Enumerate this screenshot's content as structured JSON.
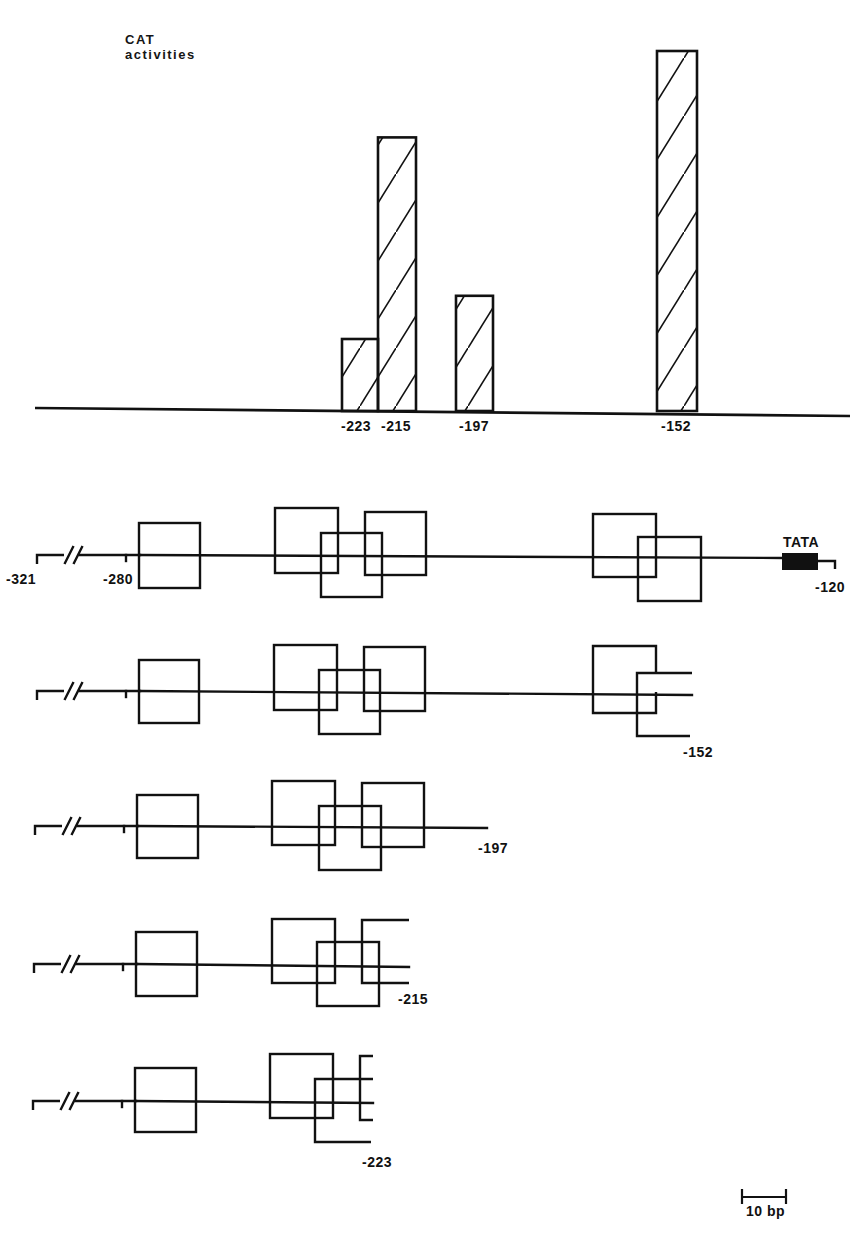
{
  "chart_data": {
    "type": "bar",
    "title": "",
    "ylabel": "CAT activities",
    "ylabel_lines": [
      "CAT",
      "activities"
    ],
    "xlabel": "",
    "y_scale": "relative (no numeric axis shown; tallest bar = 100)",
    "ylim": [
      0,
      100
    ],
    "grid": false,
    "legend": null,
    "bar_fill": "diagonal hatching",
    "categories": [
      "-223",
      "-215",
      "-197",
      "-152"
    ],
    "positions_bp": [
      -223,
      -215,
      -197,
      -152
    ],
    "values": [
      20,
      76,
      32,
      100
    ]
  },
  "diagram": {
    "constructs": [
      {
        "id": "full",
        "end_label": "-120",
        "start_labels": [
          "-321",
          "-280"
        ],
        "tata_label": "TATA",
        "has_tata": true
      },
      {
        "id": "del-152",
        "end_label": "-152",
        "has_tata": false
      },
      {
        "id": "del-197",
        "end_label": "-197",
        "has_tata": false
      },
      {
        "id": "del-215",
        "end_label": "-215",
        "has_tata": false
      },
      {
        "id": "del-223",
        "end_label": "-223",
        "has_tata": false
      }
    ],
    "scale_bar": {
      "label": "10 bp",
      "length_bp": 10
    },
    "line_color": "#111111",
    "tata_color": "#111111"
  }
}
